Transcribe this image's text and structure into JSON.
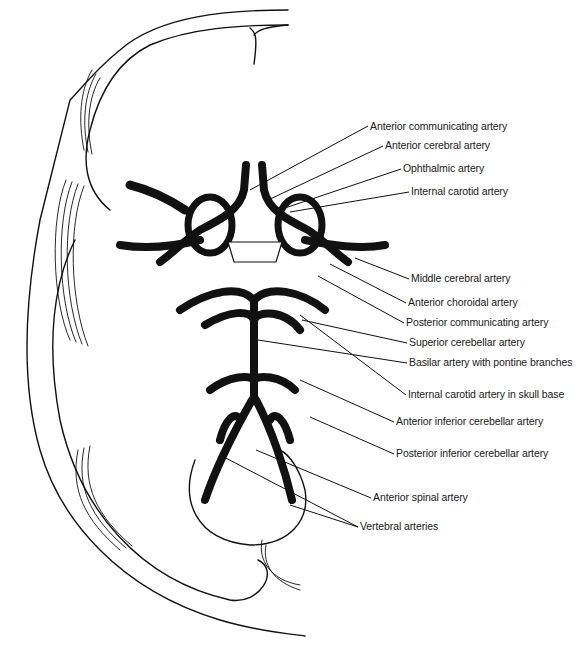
{
  "figure": {
    "line_color": "#111111",
    "background": "#ffffff"
  },
  "labels": [
    {
      "id": "acomm",
      "text": "Anterior communicating artery",
      "x": 370,
      "y": 120,
      "anchor": [
        250,
        190
      ]
    },
    {
      "id": "aca",
      "text": "Anterior cerebral artery",
      "x": 385,
      "y": 139,
      "anchor": [
        268,
        200
      ]
    },
    {
      "id": "ophth",
      "text": "Ophthalmic artery",
      "x": 403,
      "y": 162,
      "anchor": [
        285,
        208
      ]
    },
    {
      "id": "ica",
      "text": "Internal carotid artery",
      "x": 411,
      "y": 185,
      "anchor": [
        290,
        212
      ]
    },
    {
      "id": "mca",
      "text": "Middle cerebral artery",
      "x": 411,
      "y": 272,
      "anchor": [
        355,
        258
      ]
    },
    {
      "id": "achor",
      "text": "Anterior choroidal artery",
      "x": 408,
      "y": 296,
      "anchor": [
        330,
        264
      ]
    },
    {
      "id": "pcomm",
      "text": "Posterior communicating artery",
      "x": 406,
      "y": 316,
      "anchor": [
        318,
        276
      ]
    },
    {
      "id": "sca",
      "text": "Superior cerebellar artery",
      "x": 409,
      "y": 336,
      "anchor": [
        302,
        320
      ]
    },
    {
      "id": "basilar",
      "text": "Basilar artery with pontine branches",
      "x": 409,
      "y": 356,
      "anchor": [
        258,
        340
      ]
    },
    {
      "id": "ica_skull",
      "text": "Internal carotid artery in skull base",
      "x": 408,
      "y": 388,
      "anchor": [
        300,
        315
      ]
    },
    {
      "id": "aica",
      "text": "Anterior inferior cerebellar artery",
      "x": 396,
      "y": 415,
      "anchor": [
        300,
        380
      ]
    },
    {
      "id": "pica",
      "text": "Posterior inferior cerebellar artery",
      "x": 396,
      "y": 447,
      "anchor": [
        310,
        417
      ]
    },
    {
      "id": "asa",
      "text": "Anterior spinal artery",
      "x": 373,
      "y": 491,
      "anchor": [
        256,
        450
      ]
    },
    {
      "id": "vertebral",
      "text": "Vertebral arteries",
      "x": 360,
      "y": 520,
      "anchor": [
        220,
        455
      ],
      "anchor2": [
        290,
        505
      ]
    }
  ]
}
